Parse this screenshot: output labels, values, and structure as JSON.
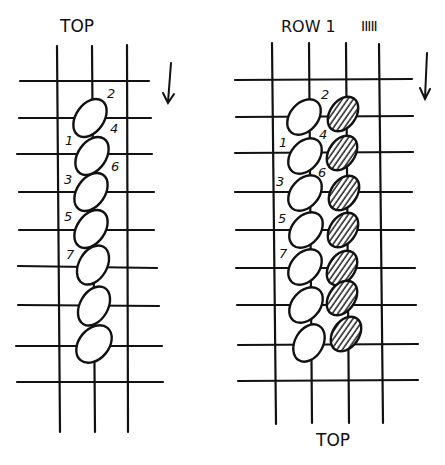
{
  "left_panel": {
    "title": "TOP",
    "arrow": "arrow-down-icon",
    "stitch_numbers": [
      "1",
      "2",
      "3",
      "4",
      "5",
      "6",
      "7"
    ],
    "stitch_count": 7,
    "columns": 3,
    "rows": 9
  },
  "right_panel": {
    "title": "ROW 1",
    "tally": "IIIII",
    "bottom_label": "TOP",
    "arrow": "arrow-down-icon",
    "stitch_numbers": [
      "1",
      "2",
      "3",
      "4",
      "5",
      "6",
      "7"
    ],
    "plain_stitch_count": 7,
    "hatched_stitch_count": 7,
    "columns": 4,
    "rows": 8
  },
  "colors": {
    "ink": "#111111",
    "paper": "#ffffff"
  }
}
